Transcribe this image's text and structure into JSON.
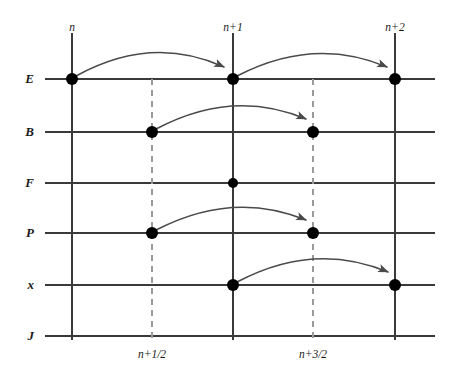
{
  "figure": {
    "title": "",
    "type": "staggered-leapfrog-time-grid",
    "width": 451,
    "height": 381,
    "background": "#ffffff",
    "line_color": "#3a3a3a",
    "dashed_color": "#9a9a9a",
    "dot_color": "#000000",
    "arrow_color": "#4a4a4a",
    "text_color": "#1a1a1a"
  },
  "rows": [
    {
      "id": "E",
      "label": "E",
      "y": 79
    },
    {
      "id": "B",
      "label": "B",
      "y": 132
    },
    {
      "id": "F",
      "label": "F",
      "y": 183
    },
    {
      "id": "P",
      "label": "P",
      "y": 233
    },
    {
      "id": "x",
      "label": "x",
      "y": 285
    },
    {
      "id": "J",
      "label": "J",
      "y": 336
    }
  ],
  "columns": [
    {
      "id": "n",
      "label": "n",
      "x": 72,
      "style": "solid",
      "label_pos": "top"
    },
    {
      "id": "nh",
      "label": "n+1/2",
      "x": 152,
      "style": "dashed",
      "label_pos": "bottom"
    },
    {
      "id": "n1",
      "label": "n+1",
      "x": 233,
      "style": "solid",
      "label_pos": "top"
    },
    {
      "id": "n3h",
      "label": "n+3/2",
      "x": 313,
      "style": "dashed",
      "label_pos": "bottom"
    },
    {
      "id": "n2",
      "label": "n+2",
      "x": 395,
      "style": "solid",
      "label_pos": "top"
    }
  ],
  "axis": {
    "row_line_start_x": 45,
    "row_line_end_x": 435,
    "col_line_top_y": 33,
    "col_line_bottom_y": 340,
    "dashed_top_y": 79,
    "dashed_bottom_y": 340
  },
  "dots": [
    {
      "row": "E",
      "col": "n",
      "x": 72,
      "y": 79,
      "r": 6
    },
    {
      "row": "E",
      "col": "n1",
      "x": 233,
      "y": 79,
      "r": 6
    },
    {
      "row": "E",
      "col": "n2",
      "x": 395,
      "y": 79,
      "r": 6
    },
    {
      "row": "B",
      "col": "nh",
      "x": 152,
      "y": 132,
      "r": 6
    },
    {
      "row": "B",
      "col": "n3h",
      "x": 313,
      "y": 132,
      "r": 6
    },
    {
      "row": "F",
      "col": "n1",
      "x": 233,
      "y": 183,
      "r": 5
    },
    {
      "row": "P",
      "col": "nh",
      "x": 152,
      "y": 233,
      "r": 6
    },
    {
      "row": "P",
      "col": "n3h",
      "x": 313,
      "y": 233,
      "r": 6
    },
    {
      "row": "x",
      "col": "n1",
      "x": 233,
      "y": 285,
      "r": 6
    },
    {
      "row": "x",
      "col": "n2",
      "x": 395,
      "y": 285,
      "r": 6
    }
  ],
  "arrows": [
    {
      "id": "E-n-to-n1",
      "row": "E",
      "from_col": "n",
      "to_col": "n1",
      "from_x": 76,
      "from_y": 76,
      "ctrl_x": 152,
      "ctrl_y": 34,
      "to_x": 224,
      "to_y": 67
    },
    {
      "id": "E-n1-to-n2",
      "row": "E",
      "from_col": "n1",
      "to_col": "n2",
      "from_x": 237,
      "from_y": 76,
      "ctrl_x": 314,
      "ctrl_y": 36,
      "to_x": 387,
      "to_y": 67
    },
    {
      "id": "B-nh-to-n3h",
      "row": "B",
      "from_col": "nh",
      "to_col": "n3h",
      "from_x": 156,
      "from_y": 129,
      "ctrl_x": 233,
      "ctrl_y": 88,
      "to_x": 306,
      "to_y": 119
    },
    {
      "id": "P-nh-to-n3h",
      "row": "P",
      "from_col": "nh",
      "to_col": "n3h",
      "from_x": 156,
      "from_y": 230,
      "ctrl_x": 233,
      "ctrl_y": 190,
      "to_x": 306,
      "to_y": 220
    },
    {
      "id": "x-n1-to-n2",
      "row": "x",
      "from_col": "n1",
      "to_col": "n2",
      "from_x": 237,
      "from_y": 282,
      "ctrl_x": 314,
      "ctrl_y": 241,
      "to_x": 388,
      "to_y": 272
    }
  ]
}
